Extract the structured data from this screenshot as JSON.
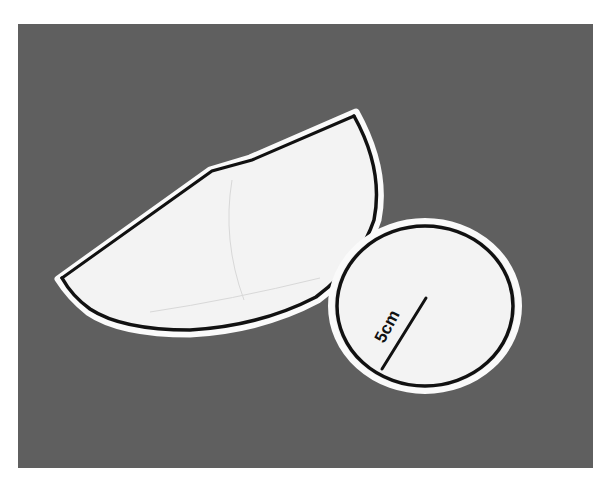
{
  "scene": {
    "description": "Photo of two paper cutouts on a gray background forming a cone net",
    "background_color": "#5f5f5f",
    "paper_color": "#f2f2f2",
    "outline_color": "#111111"
  },
  "shapes": {
    "sector": {
      "name": "cone lateral surface sector"
    },
    "circle": {
      "name": "cone base circle",
      "radius_label": "5cm"
    }
  }
}
